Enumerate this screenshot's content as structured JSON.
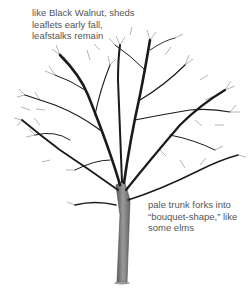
{
  "illustration": {
    "subject": "bare deciduous tree in winter silhouette",
    "trunk_color": "#7a7a7a",
    "branch_color": "#1a1a1a"
  },
  "annotations": [
    {
      "lines": [
        "like Black Walnut, sheds",
        "leaflets early fall,",
        "leafstalks remain"
      ]
    },
    {
      "lines": [
        "pale trunk forks into",
        "“bouquet-shape,” like",
        "some elms"
      ]
    }
  ]
}
